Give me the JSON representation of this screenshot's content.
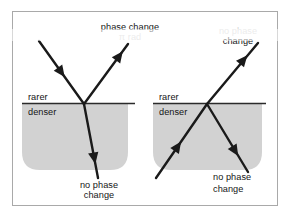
{
  "figure": {
    "frame": {
      "border_color": "#a9a9a9",
      "background_color": "#ffffff"
    },
    "colors": {
      "medium_shade": "#d2d2d2",
      "ray_color": "#1a1a1a",
      "interface_line": "#2b2b2b",
      "label_color": "#151515",
      "faded_label_color": "#b9b9b9"
    },
    "panels": [
      {
        "id": "left-panel",
        "name": "reflection-off-denser-medium",
        "labels": {
          "upper_medium": "rarer",
          "lower_medium": "denser",
          "reflected_line1": "phase change",
          "reflected_line2": "π rad",
          "reflected_faded": true,
          "transmitted_line1": "no phase",
          "transmitted_line2": "change",
          "transmitted_faded": false
        },
        "rays": {
          "incident": "from upper-left down to interface point",
          "reflected": "from interface point up to upper-right",
          "transmitted": "from interface point down into denser medium"
        }
      },
      {
        "id": "right-panel",
        "name": "reflection-off-rarer-medium",
        "labels": {
          "upper_medium": "rarer",
          "lower_medium": "denser",
          "reflected_line1": "no phase",
          "reflected_line2": "change",
          "reflected_faded": true,
          "transmitted_line1": "no phase",
          "transmitted_line2": "change",
          "transmitted_faded": false
        },
        "rays": {
          "incident": "from lower-left inside denser medium up to interface point",
          "reflected": "from interface point up to upper-right out of medium",
          "transmitted": "from interface point down-right inside denser medium"
        }
      }
    ]
  }
}
